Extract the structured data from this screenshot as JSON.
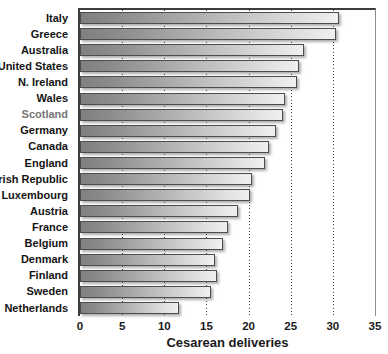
{
  "chart_data": {
    "type": "bar",
    "orientation": "horizontal",
    "title": "",
    "xlabel": "Cesarean deliveries",
    "ylabel": "",
    "xlim": [
      0,
      35
    ],
    "xticks": [
      0,
      5,
      10,
      15,
      20,
      25,
      30,
      35
    ],
    "grid": "dotted vertical gridlines at 5-30, solid line at 35",
    "legend": "none",
    "categories": [
      "Italy",
      "Greece",
      "Australia",
      "United States",
      "N. Ireland",
      "Wales",
      "Scotland",
      "Germany",
      "Canada",
      "England",
      "Irish Republic",
      "Luxembourg",
      "Austria",
      "France",
      "Belgium",
      "Denmark",
      "Finland",
      "Sweden",
      "Netherlands"
    ],
    "values": [
      30.7,
      30.4,
      26.6,
      26.0,
      25.7,
      24.3,
      24.1,
      23.3,
      22.4,
      21.9,
      20.4,
      20.2,
      18.7,
      17.6,
      17.0,
      16.0,
      16.2,
      15.5,
      11.8
    ],
    "muted_label": "Scotland"
  },
  "colors": {
    "bar_gradient_start": "#808080",
    "bar_gradient_end": "#f0f0f0",
    "bar_border": "#4d4d4d",
    "gridline": "#3f3f3f",
    "axis": "#3d3d3d",
    "plot_right_border": "#8c8c8c",
    "label": "#141414",
    "label_muted": "#757575",
    "background": "#ffffff"
  }
}
